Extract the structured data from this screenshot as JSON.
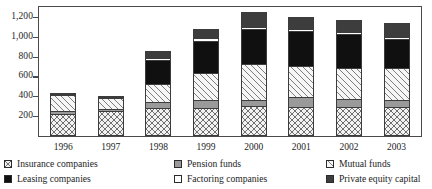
{
  "chart_data": {
    "type": "bar",
    "subtype": "stacked-vertical",
    "title": "",
    "xlabel": "",
    "ylabel": "",
    "ylim": [
      0,
      1300
    ],
    "yticks": [
      "200",
      "400",
      "600",
      "800",
      "1,000",
      "1,200"
    ],
    "ytick_values": [
      200,
      400,
      600,
      800,
      1000,
      1200
    ],
    "grid": false,
    "legend_position": "bottom",
    "categories": [
      "1996",
      "1997",
      "1998",
      "1999",
      "2000",
      "2001",
      "2002",
      "2003"
    ],
    "series": [
      {
        "name": "Insurance companies",
        "pattern": "cross-hatch",
        "color": "#f2f2f2",
        "values": [
          220,
          245,
          275,
          280,
          300,
          290,
          290,
          290
        ]
      },
      {
        "name": "Pension funds",
        "pattern": "solid-gray",
        "color": "#9a9a9a",
        "values": [
          25,
          25,
          70,
          80,
          60,
          100,
          80,
          70
        ]
      },
      {
        "name": "Mutual funds",
        "pattern": "diagonal-hatch",
        "color": "#f6f6f6",
        "values": [
          165,
          110,
          180,
          270,
          370,
          320,
          320,
          330
        ]
      },
      {
        "name": "Leasing companies",
        "pattern": "solid-black",
        "color": "#101010",
        "values": [
          5,
          5,
          240,
          330,
          350,
          350,
          340,
          290
        ]
      },
      {
        "name": "Factoring companies",
        "pattern": "solid-white",
        "color": "#ffffff",
        "values": [
          5,
          5,
          25,
          25,
          25,
          25,
          25,
          25
        ]
      },
      {
        "name": "Private equity capital",
        "pattern": "solid-darkgray",
        "color": "#3d3d3d",
        "values": [
          0,
          0,
          70,
          100,
          150,
          120,
          120,
          140
        ]
      }
    ],
    "totals": [
      420,
      390,
      860,
      1085,
      1255,
      1205,
      1175,
      1145
    ]
  },
  "legend": {
    "items": [
      {
        "label": "Insurance companies",
        "swatch": "cross-hatch-swatch"
      },
      {
        "label": "Pension funds",
        "swatch": "gray-swatch"
      },
      {
        "label": "Mutual funds",
        "swatch": "diagonal-hatch-swatch"
      },
      {
        "label": "Leasing companies",
        "swatch": "black-swatch"
      },
      {
        "label": "Factoring companies",
        "swatch": "white-swatch"
      },
      {
        "label": "Private equity capital",
        "swatch": "dark-gray-swatch"
      }
    ]
  }
}
